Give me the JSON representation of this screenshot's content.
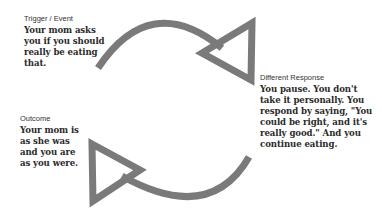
{
  "diagram": {
    "arrow_color": "#7a7a7a",
    "background": "#ffffff",
    "nodes": [
      {
        "id": "trigger",
        "label": "Trigger / Event",
        "lines": [
          "Your mom asks",
          "you if you should",
          "really be eating",
          "that."
        ]
      },
      {
        "id": "response",
        "label": "Different Response",
        "lines": [
          "You pause. You don't",
          "take it personally. You",
          "respond by saying, \"You",
          "could be right, and it's",
          "really good.\" And you",
          "continue eating."
        ]
      },
      {
        "id": "outcome",
        "label": "Outcome",
        "lines": [
          "Your mom is",
          "as she was",
          "and you are",
          "as you were."
        ]
      }
    ],
    "arrows": [
      {
        "id": "arrow-top",
        "from": "trigger",
        "to": "response",
        "icon": "curved-arrow-right-icon"
      },
      {
        "id": "arrow-bottom",
        "from": "response",
        "to": "outcome",
        "icon": "curved-arrow-left-icon"
      }
    ]
  }
}
